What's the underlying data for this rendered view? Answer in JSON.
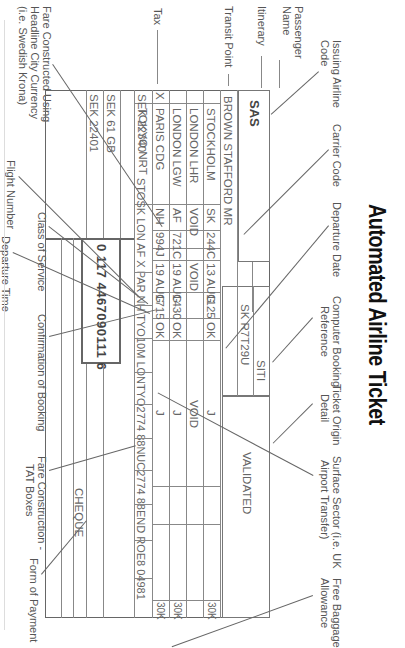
{
  "title": "Automated Airline Ticket",
  "labels": {
    "issuing_airline_code": [
      "Issuing Airline",
      "Code"
    ],
    "carrier_code": "Carrier Code",
    "departure_date": "Departure Date",
    "computer_booking_reference": [
      "Computer Booking",
      "Reference"
    ],
    "ticket_origin_detail": [
      "Ticket Origin",
      "Detail"
    ],
    "surface_sector": [
      "Surface Sector (i.e. UK",
      "Airport Transfer)"
    ],
    "free_baggage_allowance": [
      "Free Baggage",
      "Allowance"
    ],
    "passenger_name": [
      "Passenger",
      "Name"
    ],
    "itinerary": "Itinerary",
    "transit_point": "Transit Point",
    "tax": "Tax",
    "fare_constructed": [
      "Fare Constructed Using",
      "Headline City Currency",
      "(i.e. Swedish Krona)"
    ],
    "flight_number": "Flight Number",
    "class_of_service": "Class of Service",
    "departure_time": "Departure Time",
    "confirmation_of_booking": "Confirmation of Booking",
    "fare_construction_tat": [
      "Fare Construction -",
      "TAT Boxes"
    ],
    "form_of_payment": "Form of Payment"
  },
  "ticket": {
    "issuing_airline": "SAS",
    "passenger": "BROWN STAFFORD MR",
    "booking_reference": "SK R7T29U",
    "origin_detail": "SITI",
    "validated": "VALIDATED",
    "itinerary": [
      {
        "transit": "",
        "city": "STOCKHOLM",
        "carrier": "SK",
        "flight": "244",
        "class": "C",
        "date": "13 AUG",
        "time": "1125",
        "status": "OK",
        "fare_basis": "J",
        "baggage": "30K"
      },
      {
        "transit": "",
        "city": "LONDON LHR",
        "carrier": "VOID",
        "flight": "",
        "class": "",
        "date": "VOID",
        "time": "",
        "status": "",
        "fare_basis": "VOID",
        "baggage": ""
      },
      {
        "transit": "",
        "city": "LONDON LGW",
        "carrier": "AF",
        "flight": "721",
        "class": "C",
        "date": "19 AUG",
        "time": "1430",
        "status": "OK",
        "fare_basis": "J",
        "baggage": "30K"
      },
      {
        "transit": "X",
        "city": "PARIS CDG",
        "carrier": "NH",
        "flight": "994",
        "class": "J",
        "date": "19 AUG",
        "time": "1715",
        "status": "OK",
        "fare_basis": "J",
        "baggage": "30K"
      },
      {
        "transit": "",
        "city": "TOKYO NRT",
        "carrier": "",
        "flight": "",
        "class": "",
        "date": "",
        "time": "",
        "status": "",
        "fare_basis": "",
        "baggage": ""
      }
    ],
    "fare": "SEK 22340",
    "tax": "SEK 61 GB",
    "total": "SEK 22401",
    "fare_calculation": "STOSK LON AF X PAR NH TYO10M LONTYO2774 88NUC2774 88END ROE8 04981",
    "ticket_number": "0  117  4467090111  6",
    "payment": "CHEQUE"
  }
}
